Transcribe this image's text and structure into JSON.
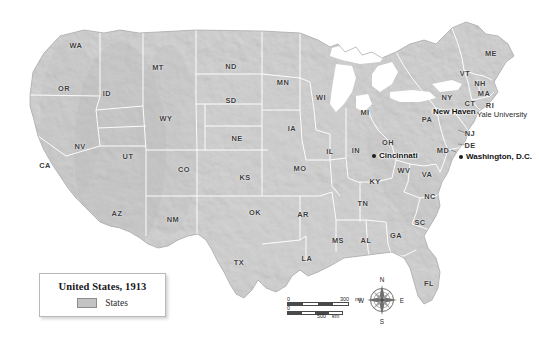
{
  "map": {
    "title": "United States, 1913",
    "projection_note": "",
    "land_color": "#c6c6c6",
    "water_color": "#ffffff",
    "border_color": "#ffffff",
    "label_color": "#3c3c3c"
  },
  "legend": {
    "title": "United States, 1913",
    "entries": [
      {
        "label": "States",
        "swatch_color": "#c3c3c3"
      }
    ]
  },
  "states": [
    {
      "abbr": "WA",
      "x": 76,
      "y": 45
    },
    {
      "abbr": "OR",
      "x": 64,
      "y": 88
    },
    {
      "abbr": "ID",
      "x": 107,
      "y": 93
    },
    {
      "abbr": "MT",
      "x": 158,
      "y": 67
    },
    {
      "abbr": "WY",
      "x": 166,
      "y": 118
    },
    {
      "abbr": "NV",
      "x": 80,
      "y": 146
    },
    {
      "abbr": "CA",
      "x": 45,
      "y": 165
    },
    {
      "abbr": "UT",
      "x": 128,
      "y": 156
    },
    {
      "abbr": "CO",
      "x": 184,
      "y": 169
    },
    {
      "abbr": "AZ",
      "x": 117,
      "y": 213
    },
    {
      "abbr": "NM",
      "x": 173,
      "y": 219
    },
    {
      "abbr": "ND",
      "x": 231,
      "y": 66
    },
    {
      "abbr": "SD",
      "x": 231,
      "y": 100
    },
    {
      "abbr": "NE",
      "x": 237,
      "y": 138
    },
    {
      "abbr": "KS",
      "x": 245,
      "y": 177
    },
    {
      "abbr": "OK",
      "x": 255,
      "y": 212
    },
    {
      "abbr": "TX",
      "x": 239,
      "y": 262
    },
    {
      "abbr": "MN",
      "x": 283,
      "y": 82
    },
    {
      "abbr": "IA",
      "x": 292,
      "y": 128
    },
    {
      "abbr": "MO",
      "x": 300,
      "y": 168
    },
    {
      "abbr": "AR",
      "x": 303,
      "y": 214
    },
    {
      "abbr": "LA",
      "x": 307,
      "y": 258
    },
    {
      "abbr": "WI",
      "x": 321,
      "y": 97
    },
    {
      "abbr": "IL",
      "x": 330,
      "y": 151
    },
    {
      "abbr": "IN",
      "x": 356,
      "y": 150
    },
    {
      "abbr": "MI",
      "x": 365,
      "y": 112
    },
    {
      "abbr": "OH",
      "x": 388,
      "y": 142
    },
    {
      "abbr": "KY",
      "x": 375,
      "y": 181
    },
    {
      "abbr": "TN",
      "x": 363,
      "y": 203
    },
    {
      "abbr": "MS",
      "x": 338,
      "y": 240
    },
    {
      "abbr": "AL",
      "x": 366,
      "y": 240
    },
    {
      "abbr": "GA",
      "x": 396,
      "y": 235
    },
    {
      "abbr": "FL",
      "x": 429,
      "y": 283
    },
    {
      "abbr": "SC",
      "x": 420,
      "y": 222
    },
    {
      "abbr": "NC",
      "x": 430,
      "y": 196
    },
    {
      "abbr": "WV",
      "x": 404,
      "y": 170
    },
    {
      "abbr": "VA",
      "x": 427,
      "y": 174
    },
    {
      "abbr": "MD",
      "x": 443,
      "y": 150
    },
    {
      "abbr": "DE",
      "x": 470,
      "y": 145
    },
    {
      "abbr": "NJ",
      "x": 470,
      "y": 133
    },
    {
      "abbr": "PA",
      "x": 427,
      "y": 119
    },
    {
      "abbr": "NY",
      "x": 447,
      "y": 97
    },
    {
      "abbr": "CT",
      "x": 470,
      "y": 103
    },
    {
      "abbr": "RI",
      "x": 490,
      "y": 105
    },
    {
      "abbr": "MA",
      "x": 484,
      "y": 93
    },
    {
      "abbr": "NH",
      "x": 480,
      "y": 83
    },
    {
      "abbr": "VT",
      "x": 465,
      "y": 73
    },
    {
      "abbr": "ME",
      "x": 491,
      "y": 53
    }
  ],
  "cities": [
    {
      "name": "Cincinnati",
      "x": 374,
      "y": 156,
      "label_dx": 5,
      "label_dy": 0
    },
    {
      "name": "New Haven",
      "x": 470,
      "y": 112,
      "label_dx": -5,
      "label_dy": 0,
      "label_anchor": "end"
    },
    {
      "name": "Washington, D.C.",
      "x": 461,
      "y": 157,
      "label_dx": 5,
      "label_dy": 1
    }
  ],
  "points_of_interest": [
    {
      "name": "Yale University",
      "x": 477,
      "y": 114
    }
  ],
  "scalebar": {
    "miles": {
      "start": "0",
      "end": "300",
      "unit": "mi."
    },
    "kilometers": {
      "start": "0",
      "end": "500",
      "unit": "km"
    }
  },
  "compass": {
    "north": "N",
    "south": "S",
    "east": "E",
    "west": "W"
  }
}
